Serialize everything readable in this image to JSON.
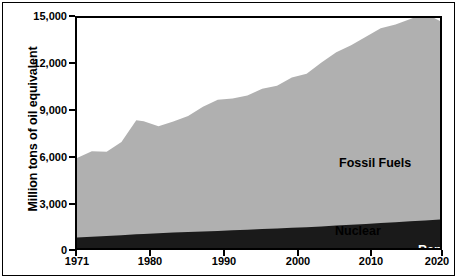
{
  "chart_data": {
    "type": "area",
    "title": "",
    "xlabel": "",
    "ylabel": "Million tons of oil equivalent",
    "stacked": true,
    "grid": false,
    "legend_position": "inline-annotations",
    "xlim": [
      1971,
      2020
    ],
    "ylim": [
      0,
      15000
    ],
    "x_ticks": [
      "1971",
      "1980",
      "1990",
      "2000",
      "2010",
      "2020"
    ],
    "x_tick_values": [
      1971,
      1980,
      1990,
      2000,
      2010,
      2020
    ],
    "y_ticks": [
      "0",
      "3,000",
      "6,000",
      "9,000",
      "12,000",
      "15,000"
    ],
    "y_tick_values": [
      0,
      3000,
      6000,
      9000,
      12000,
      15000
    ],
    "x": [
      1971,
      1973,
      1975,
      1977,
      1979,
      1980,
      1982,
      1984,
      1986,
      1988,
      1990,
      1992,
      1994,
      1996,
      1998,
      2000,
      2002,
      2004,
      2006,
      2008,
      2010,
      2012,
      2014,
      2016,
      2018,
      2020
    ],
    "series": [
      {
        "name": "Renewables",
        "color": "#1a1a1a",
        "values": [
          640,
          670,
          700,
          730,
          760,
          770,
          800,
          830,
          860,
          890,
          920,
          960,
          1000,
          1040,
          1080,
          1120,
          1170,
          1220,
          1280,
          1340,
          1400,
          1460,
          1520,
          1580,
          1640,
          1700
        ]
      },
      {
        "name": "Nuclear",
        "color": "#1a1a1a",
        "values": [
          40,
          60,
          80,
          105,
          130,
          140,
          160,
          175,
          185,
          190,
          195,
          195,
          195,
          195,
          195,
          195,
          190,
          185,
          180,
          175,
          170,
          165,
          160,
          158,
          157,
          155
        ]
      },
      {
        "name": "Fossil Fuels",
        "color": "#b0b0b0",
        "values": [
          5190,
          5580,
          5500,
          6080,
          7440,
          7350,
          6980,
          7250,
          7560,
          8130,
          8560,
          8600,
          8750,
          9150,
          9300,
          9800,
          10000,
          10700,
          11300,
          11700,
          12200,
          12700,
          12900,
          13200,
          13500,
          12950
        ]
      }
    ],
    "stack_totals_note": "Fossil Fuels band top: 5,870 (1971) rising to 14,800 (2020); black band (Renewables + Nuclear) top: 680 (1971) rising to 1,855 (2020)",
    "annotations": [
      {
        "name": "Fossil Fuels",
        "text": "Fossil Fuels",
        "color": "#000000"
      },
      {
        "name": "Nuclear",
        "text": "Nuclear",
        "color": "#000000"
      },
      {
        "name": "Renewables",
        "text": "Renewables",
        "color": "#ffffff"
      }
    ]
  },
  "axis": {
    "y_title": "Million tons of oil equivalent",
    "y_labels": [
      "15,000",
      "12,000",
      "9,000",
      "6,000",
      "3,000",
      "0"
    ],
    "x_labels": [
      "1971",
      "1980",
      "1990",
      "2000",
      "2010",
      "2020"
    ]
  },
  "labels": {
    "fossil": "Fossil Fuels",
    "nuclear": "Nuclear",
    "renewables": "Renewables"
  },
  "colors": {
    "fossil_fuels": "#b0b0b0",
    "black_band": "#1a1a1a",
    "background": "#ffffff",
    "axis": "#000000"
  }
}
